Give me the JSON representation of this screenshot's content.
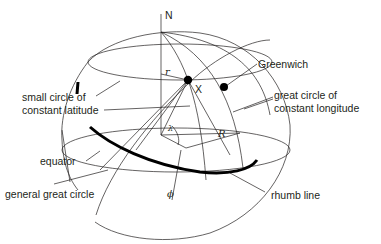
{
  "diagram": {
    "type": "spherical-geometry",
    "colors": {
      "line": "#231f20",
      "background": "#ffffff"
    },
    "labels": {
      "north": "N",
      "greenwich": "Greenwich",
      "point_x": "X",
      "radius_small": "r",
      "radius_sphere": "R",
      "lambda": "λ",
      "phi": "ϕ",
      "small_circle_line1": "small circle of",
      "small_circle_line2": "constant latitude",
      "great_circle_line1": "great circle of",
      "great_circle_line2": "constant  longitude",
      "equator": "equator",
      "general_great_circle": "general great circle",
      "rhumb_line": "rhumb line"
    }
  }
}
